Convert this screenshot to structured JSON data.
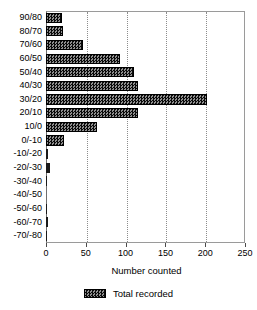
{
  "chart_data": {
    "type": "bar",
    "orientation": "horizontal",
    "title": "",
    "xlabel": "Number counted",
    "ylabel": "",
    "xlim": [
      0,
      250
    ],
    "xticks": [
      0,
      50,
      100,
      150,
      200,
      250
    ],
    "xtick_labels": [
      "0",
      "50",
      "100",
      "150",
      "200",
      "250"
    ],
    "grid": "vertical-dotted",
    "legend_position": "bottom-center",
    "categories": [
      "90/80",
      "80/70",
      "70/60",
      "60/50",
      "50/40",
      "40/30",
      "30/20",
      "20/10",
      "10/0",
      "0/-10",
      "-10/-20",
      "-20/-30",
      "-30/-40",
      "-40/-50",
      "-50/-60",
      "-60/-70",
      "-70/-80"
    ],
    "series": [
      {
        "name": "Total recorded",
        "values": [
          20,
          21,
          47,
          93,
          110,
          115,
          202,
          116,
          64,
          23,
          2,
          5,
          1,
          0,
          1,
          2,
          1
        ]
      }
    ]
  },
  "legend": {
    "items": [
      {
        "label": "Total recorded",
        "swatch": "hatched-dark"
      }
    ]
  },
  "colors": {
    "bar_fill": "#2b2b2b",
    "bar_edge": "#000000",
    "axis": "#6e6e6e",
    "grid": "#8c8c8c",
    "text": "#000000",
    "background": "#ffffff"
  }
}
